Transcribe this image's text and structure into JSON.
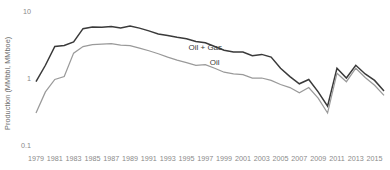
{
  "chart_data": {
    "type": "line",
    "title": "",
    "subtitle": "",
    "xlabel": "",
    "ylabel": "Production (MMbbl, MMboe)",
    "yscale": "log",
    "ylim": [
      0.1,
      10
    ],
    "xlim": [
      1979,
      2016
    ],
    "grid": false,
    "legend_position": "inline-annotation",
    "ytick_labels": [
      "10",
      "1",
      "0.1"
    ],
    "ytick_values": [
      10,
      1,
      0.1
    ],
    "xtick_labels": [
      "1979",
      "1981",
      "1983",
      "1985",
      "1987",
      "1989",
      "1991",
      "1993",
      "1995",
      "1997",
      "1999",
      "2001",
      "2003",
      "2005",
      "2007",
      "2009",
      "2011",
      "2013",
      "2015"
    ],
    "xtick_values": [
      1979,
      1981,
      1983,
      1985,
      1987,
      1989,
      1991,
      1993,
      1995,
      1997,
      1999,
      2001,
      2003,
      2005,
      2007,
      2009,
      2011,
      2013,
      2015
    ],
    "x": [
      1979,
      1980,
      1981,
      1982,
      1983,
      1984,
      1985,
      1986,
      1987,
      1988,
      1989,
      1990,
      1991,
      1992,
      1993,
      1994,
      1995,
      1996,
      1997,
      1998,
      1999,
      2000,
      2001,
      2002,
      2003,
      2004,
      2005,
      2006,
      2007,
      2008,
      2009,
      2010,
      2011,
      2012,
      2013,
      2014,
      2015,
      2016
    ],
    "series": [
      {
        "name": "Oil + Gas",
        "color": "#3a3a3a",
        "label_x": 1997,
        "label_y": 2.6,
        "values": [
          0.88,
          1.55,
          2.95,
          3.05,
          3.45,
          5.45,
          5.75,
          5.7,
          5.85,
          5.6,
          5.95,
          5.55,
          5.05,
          4.55,
          4.3,
          4.05,
          3.85,
          3.5,
          3.35,
          2.95,
          2.6,
          2.45,
          2.45,
          2.15,
          2.25,
          2.05,
          1.4,
          1.05,
          0.82,
          0.95,
          0.62,
          0.38,
          1.4,
          1.0,
          1.55,
          1.15,
          0.92,
          0.64
        ]
      },
      {
        "name": "Oil",
        "color": "#9a9a9a",
        "label_x": 1998,
        "label_y": 1.55,
        "values": [
          0.3,
          0.62,
          0.95,
          1.05,
          2.35,
          2.95,
          3.15,
          3.2,
          3.25,
          3.1,
          3.05,
          2.8,
          2.55,
          2.3,
          2.05,
          1.85,
          1.7,
          1.55,
          1.58,
          1.4,
          1.22,
          1.15,
          1.12,
          1.0,
          1.0,
          0.92,
          0.8,
          0.72,
          0.6,
          0.72,
          0.5,
          0.3,
          1.18,
          0.88,
          1.4,
          1.02,
          0.78,
          0.55
        ]
      }
    ]
  },
  "axis": {
    "ylabel": "Production (MMbbl, MMboe)"
  }
}
